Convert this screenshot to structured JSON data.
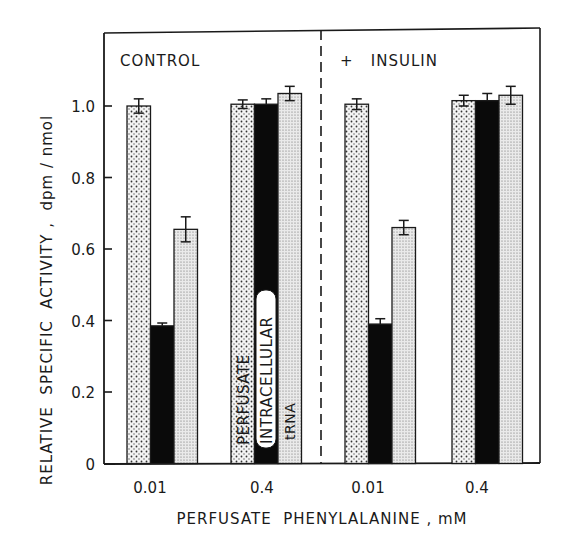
{
  "chart_data": {
    "type": "bar",
    "title": "",
    "xlabel": "PERFUSATE PHENYLALANINE, mM",
    "ylabel": "RELATIVE SPECIFIC ACTIVITY, dpm / nmol",
    "ylim": [
      0,
      1.2
    ],
    "yticks": [
      0,
      0.2,
      0.4,
      0.6,
      0.8,
      1.0
    ],
    "ytick_labels": [
      "0",
      "0.2",
      "0.4",
      "0.6",
      "0.8",
      "1.0"
    ],
    "grid": false,
    "panels": [
      {
        "label": "CONTROL",
        "categories": [
          "0.01",
          "0.4"
        ],
        "series": [
          {
            "name": "PERFUSATE",
            "values": [
              1.0,
              1.005
            ],
            "errors": [
              0.02,
              0.012
            ]
          },
          {
            "name": "INTRACELLULAR",
            "values": [
              0.385,
              1.005
            ],
            "errors": [
              0.008,
              0.015
            ]
          },
          {
            "name": "tRNA",
            "values": [
              0.655,
              1.035
            ],
            "errors": [
              0.035,
              0.02
            ]
          }
        ]
      },
      {
        "label": "+ INSULIN",
        "categories": [
          "0.01",
          "0.4"
        ],
        "series": [
          {
            "name": "PERFUSATE",
            "values": [
              1.005,
              1.015
            ],
            "errors": [
              0.015,
              0.015
            ]
          },
          {
            "name": "INTRACELLULAR",
            "values": [
              0.39,
              1.015
            ],
            "errors": [
              0.015,
              0.02
            ]
          },
          {
            "name": "tRNA",
            "values": [
              0.66,
              1.03
            ],
            "errors": [
              0.02,
              0.025
            ]
          }
        ]
      }
    ],
    "legend": {
      "position": "inline-on-bars",
      "entries": [
        "PERFUSATE",
        "INTRACELLULAR",
        "tRNA"
      ]
    },
    "divider": "dashed vertical line between CONTROL and + INSULIN panels"
  },
  "labels": {
    "panel_control": "CONTROL",
    "panel_insulin": "+   INSULIN",
    "xlabel": "PERFUSATE  PHENYLALANINE , mM",
    "ylabel": "RELATIVE  SPECIFIC  ACTIVITY ,  dpm / nmol",
    "legend_perfusate": "PERFUSATE",
    "legend_intracellular": "INTRACELLULAR",
    "legend_trna": "tRNA",
    "x_ticks": [
      "0.01",
      "0.4",
      "0.01",
      "0.4"
    ],
    "y_ticks": [
      "0",
      "0.2",
      "0.4",
      "0.6",
      "0.8",
      "1.0"
    ]
  },
  "colors": {
    "perfusate": "#e8e8e8",
    "intracellular": "#0a0a0a",
    "trna": "#d8d8d8",
    "axis": "#1a1a1a"
  }
}
